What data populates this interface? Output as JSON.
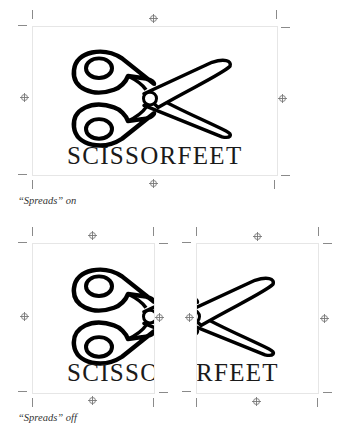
{
  "figure": {
    "top_example": {
      "wordmark": "SCISSORFEET",
      "caption": "“Spreads” on"
    },
    "bottom_example": {
      "left_page_wordmark": "SCISSO",
      "right_page_wordmark": "RFEET",
      "caption": "“Spreads” off"
    }
  },
  "icons": {
    "logo": "scissors-icon",
    "registration_mark": "registration-crosshair-icon",
    "crop_mark": "crop-mark-icon"
  },
  "colors": {
    "ink": "#111111",
    "crop_marks": "#8a8a8a",
    "frame_border": "#e6e6e6"
  }
}
